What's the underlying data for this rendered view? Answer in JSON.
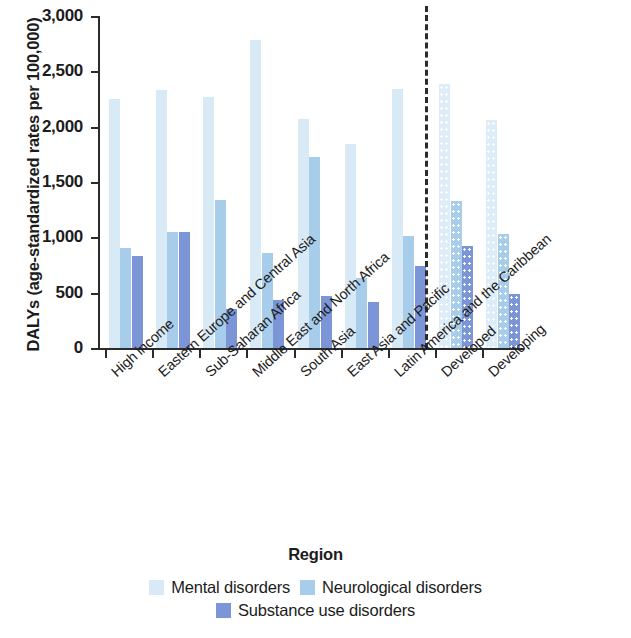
{
  "chart_data": {
    "type": "bar",
    "title": "",
    "xlabel": "Region",
    "ylabel": "DALYs (age-standardized rates per 100,000)",
    "ylim": [
      0,
      3000
    ],
    "ytick_labels": [
      "0",
      "500",
      "1,000",
      "1,500",
      "2,000",
      "2,500",
      "3,000"
    ],
    "ytick_values": [
      0,
      500,
      1000,
      1500,
      2000,
      2500,
      3000
    ],
    "grid": false,
    "legend_position": "bottom",
    "categories": [
      "High income",
      "Eastern Europe and Central Asia",
      "Sub-Saharan Africa",
      "Middle East and North Africa",
      "South Asia",
      "East Asia and Pacific",
      "Latin America and the Caribbean",
      "Developed",
      "Developing"
    ],
    "series": [
      {
        "name": "Mental disorders",
        "color": "#d9eaf7",
        "values": [
          2250,
          2330,
          2270,
          2780,
          2070,
          1840,
          2340,
          2390,
          2060
        ]
      },
      {
        "name": "Neurological disorders",
        "color": "#a8cdea",
        "values": [
          900,
          1050,
          1340,
          860,
          1730,
          630,
          1010,
          1330,
          1030
        ]
      },
      {
        "name": "Substance use disorders",
        "color": "#7b95d6",
        "values": [
          830,
          1050,
          355,
          430,
          470,
          420,
          740,
          920,
          490
        ]
      }
    ],
    "annotations": [
      {
        "name": "divider",
        "type": "dashed-vertical-line",
        "after_category": "Latin America and the Caribbean"
      }
    ],
    "pattern_note": {
      "dotted_categories": [
        "Developed",
        "Developing"
      ]
    }
  }
}
